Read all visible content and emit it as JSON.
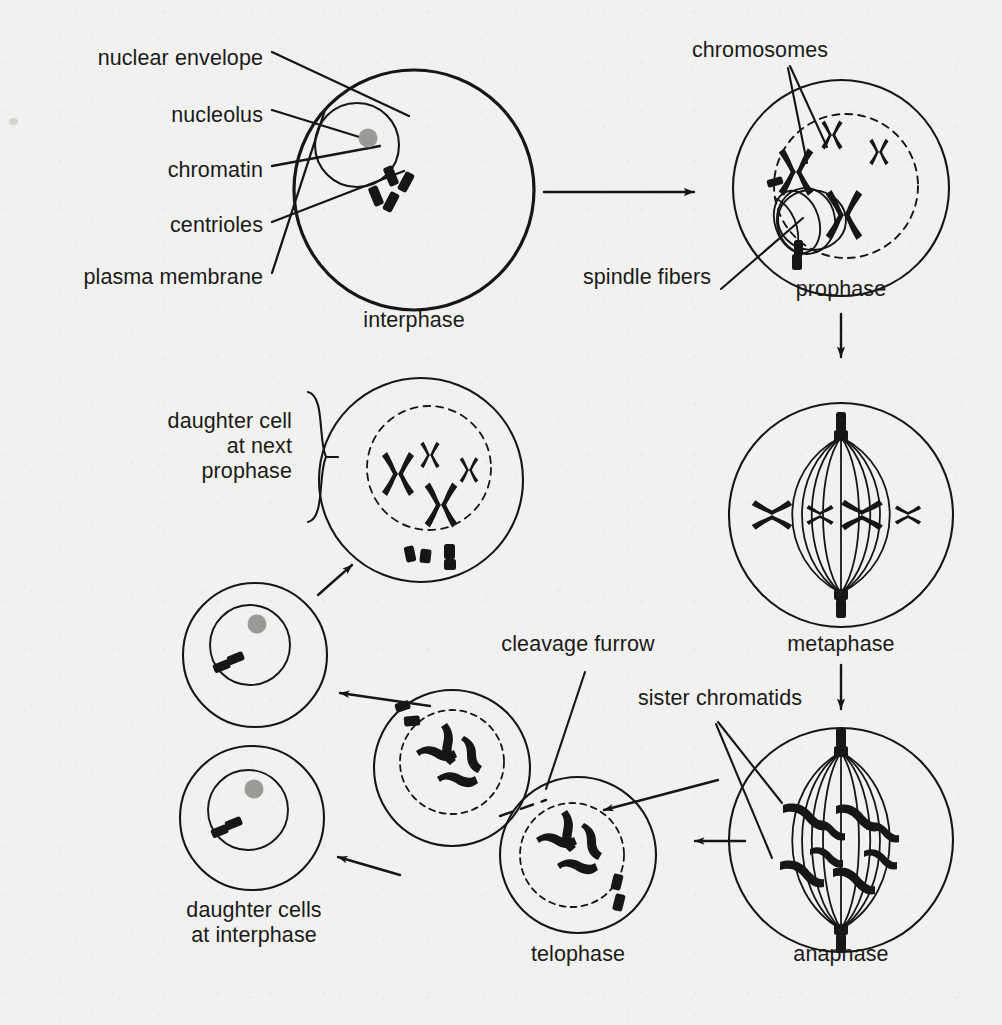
{
  "diagram": {
    "ink_color": "#161614",
    "paper_color": "#f1f1ef",
    "nucleolus_color": "#9a9a96"
  },
  "callout_labels": [
    {
      "id": "nuclear-envelope",
      "text": "nuclear envelope",
      "x": 263,
      "y": 57,
      "align": "right"
    },
    {
      "id": "nucleolus",
      "text": "nucleolus",
      "x": 263,
      "y": 114,
      "align": "right"
    },
    {
      "id": "chromatin",
      "text": "chromatin",
      "x": 263,
      "y": 169,
      "align": "right"
    },
    {
      "id": "centrioles",
      "text": "centrioles",
      "x": 263,
      "y": 224,
      "align": "right"
    },
    {
      "id": "plasma-membrane",
      "text": "plasma membrane",
      "x": 263,
      "y": 276,
      "align": "right"
    },
    {
      "id": "chromosomes",
      "text": "chromosomes",
      "x": 760,
      "y": 49,
      "align": "center"
    },
    {
      "id": "spindle-fibers",
      "text": "spindle fibers",
      "x": 711,
      "y": 276,
      "align": "right"
    },
    {
      "id": "cleavage-furrow",
      "text": "cleavage furrow",
      "x": 578,
      "y": 643,
      "align": "center"
    },
    {
      "id": "sister-chromatids",
      "text": "sister chromatids",
      "x": 720,
      "y": 697,
      "align": "center"
    }
  ],
  "stage_labels": [
    {
      "id": "interphase",
      "text": "interphase",
      "x": 414,
      "y": 319,
      "align": "center"
    },
    {
      "id": "prophase",
      "text": "prophase",
      "x": 841,
      "y": 288,
      "align": "center"
    },
    {
      "id": "metaphase",
      "text": "metaphase",
      "x": 841,
      "y": 643,
      "align": "center"
    },
    {
      "id": "anaphase",
      "text": "anaphase",
      "x": 841,
      "y": 953,
      "align": "center"
    },
    {
      "id": "telophase",
      "text": "telophase",
      "x": 578,
      "y": 953,
      "align": "center"
    },
    {
      "id": "daughter-cells-interphase",
      "text": "daughter cells\nat interphase",
      "x": 254,
      "y": 910,
      "align": "center"
    },
    {
      "id": "daughter-cell-next-prophase",
      "text": "daughter cell\n at next\nprophase",
      "x": 292,
      "y": 421,
      "align": "right"
    }
  ],
  "stages": [
    {
      "id": "interphase",
      "name": "interphase",
      "cx": 414,
      "cy": 190,
      "r": 120,
      "nucleus": {
        "cx": 357,
        "cy": 145,
        "r": 42,
        "envelope": "solid"
      },
      "nucleolus": {
        "cx": 368,
        "cy": 138,
        "r": 9
      },
      "centrioles": 4,
      "chromosomes": "chromatin (diffuse, not condensed)"
    },
    {
      "id": "prophase",
      "name": "prophase",
      "cx": 841,
      "cy": 188,
      "r": 108,
      "nucleus": {
        "cx": 846,
        "cy": 186,
        "r": 72,
        "envelope": "dashed"
      },
      "centrioles": 2,
      "chromosomes": 4,
      "has_spindle_aster": true
    },
    {
      "id": "metaphase",
      "name": "metaphase",
      "cx": 841,
      "cy": 515,
      "r": 112,
      "nucleus": null,
      "centrioles": 2,
      "chromosomes": 4,
      "spindle_fibers": 9,
      "plate": "chromosomes aligned on equator"
    },
    {
      "id": "anaphase",
      "name": "anaphase",
      "cx": 841,
      "cy": 840,
      "r": 112,
      "nucleus": null,
      "centrioles": 2,
      "chromatid_groups": 2,
      "spindle_fibers": 9,
      "note": "sister chromatids pulled to opposite poles"
    },
    {
      "id": "telophase-upper",
      "name": "telophase (upper cell)",
      "cx": 452,
      "cy": 768,
      "r": 78,
      "nucleus": {
        "cx": 452,
        "cy": 762,
        "r": 52,
        "envelope": "dashed"
      },
      "centrioles": 2,
      "chromatids": 4
    },
    {
      "id": "telophase-lower",
      "name": "telophase (lower cell)",
      "cx": 578,
      "cy": 855,
      "r": 78,
      "nucleus": {
        "cx": 572,
        "cy": 855,
        "r": 52,
        "envelope": "dashed"
      },
      "centrioles": 2,
      "chromatids": 4
    },
    {
      "id": "daughter-cell-upper",
      "name": "daughter cell at interphase (upper)",
      "cx": 255,
      "cy": 655,
      "r": 72,
      "nucleus": {
        "cx": 250,
        "cy": 645,
        "r": 40,
        "envelope": "solid"
      },
      "nucleolus": {
        "cx": 257,
        "cy": 624,
        "r": 9
      },
      "centrioles": 2
    },
    {
      "id": "daughter-cell-lower",
      "name": "daughter cell at interphase (lower)",
      "cx": 252,
      "cy": 818,
      "r": 72,
      "nucleus": {
        "cx": 248,
        "cy": 810,
        "r": 40,
        "envelope": "solid"
      },
      "nucleolus": {
        "cx": 254,
        "cy": 789,
        "r": 9
      },
      "centrioles": 2
    },
    {
      "id": "daughter-cell-next-prophase",
      "name": "daughter cell at next prophase",
      "cx": 421,
      "cy": 480,
      "r": 102,
      "nucleus": {
        "cx": 429,
        "cy": 468,
        "r": 62,
        "envelope": "dashed"
      },
      "centrioles": 4,
      "chromosomes": 4
    }
  ],
  "arrows": [
    {
      "id": "interphase-to-prophase",
      "from": "interphase",
      "to": "prophase",
      "direction": "right"
    },
    {
      "id": "prophase-to-metaphase",
      "from": "prophase",
      "to": "metaphase",
      "direction": "down"
    },
    {
      "id": "metaphase-to-anaphase",
      "from": "metaphase",
      "to": "anaphase",
      "direction": "down"
    },
    {
      "id": "anaphase-to-telophase",
      "from": "anaphase",
      "to": "telophase",
      "direction": "up-left"
    },
    {
      "id": "anaphase-to-telophase-2",
      "from": "anaphase",
      "to": "telophase",
      "direction": "left"
    },
    {
      "id": "telophase-to-daughter-1",
      "from": "telophase",
      "to": "daughter-cell-upper",
      "direction": "left"
    },
    {
      "id": "telophase-to-daughter-2",
      "from": "telophase",
      "to": "daughter-cell-lower",
      "direction": "left"
    },
    {
      "id": "daughter-to-next-prophase",
      "from": "daughter-cell-upper",
      "to": "daughter-cell-next-prophase",
      "direction": "up-right"
    }
  ],
  "legend_note": "Stages of mitosis shown in cyclical order: interphase → prophase → metaphase → anaphase → telophase → daughter cells at interphase → daughter cell at next prophase."
}
